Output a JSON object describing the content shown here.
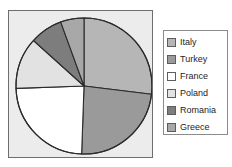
{
  "chart_data": {
    "type": "pie",
    "title": "",
    "xlabel": "",
    "ylabel": "",
    "grid": false,
    "legend_position": "right",
    "start_angle_deg": 0,
    "direction": "clockwise",
    "categories": [
      "Italy",
      "Turkey",
      "France",
      "Poland",
      "Romania",
      "Greece"
    ],
    "values": [
      27,
      24,
      24,
      12,
      8,
      5
    ],
    "units": "percent",
    "colors": [
      "#b6b6b6",
      "#9a9a9a",
      "#ffffff",
      "#e2e2e2",
      "#7d7d7d",
      "#a8a8a8"
    ],
    "slices": [
      {
        "label": "Italy",
        "value": 27,
        "color": "#b6b6b6",
        "start_deg": 0,
        "end_deg": 97
      },
      {
        "label": "Turkey",
        "value": 24,
        "color": "#9a9a9a",
        "start_deg": 97,
        "end_deg": 182
      },
      {
        "label": "France",
        "value": 24,
        "color": "#ffffff",
        "start_deg": 182,
        "end_deg": 268
      },
      {
        "label": "Poland",
        "value": 12,
        "color": "#e2e2e2",
        "start_deg": 268,
        "end_deg": 312
      },
      {
        "label": "Romania",
        "value": 8,
        "color": "#7d7d7d",
        "start_deg": 312,
        "end_deg": 340
      },
      {
        "label": "Greece",
        "value": 5,
        "color": "#a8a8a8",
        "start_deg": 340,
        "end_deg": 360
      }
    ]
  },
  "plot": {
    "background_color": "#ececed",
    "border_color": "#6e6e70",
    "pie_center_x": 75,
    "pie_center_y": 75,
    "pie_radius": 68,
    "outline_color": "#2b2b2b"
  },
  "legend": {
    "background_color": "#ffffff",
    "border_color": "#8b8b8d",
    "items": [
      {
        "label": "Italy",
        "color": "#b6b6b6"
      },
      {
        "label": "Turkey",
        "color": "#9a9a9a"
      },
      {
        "label": "France",
        "color": "#ffffff"
      },
      {
        "label": "Poland",
        "color": "#e2e2e2"
      },
      {
        "label": "Romania",
        "color": "#7d7d7d"
      },
      {
        "label": "Greece",
        "color": "#a8a8a8"
      }
    ]
  }
}
